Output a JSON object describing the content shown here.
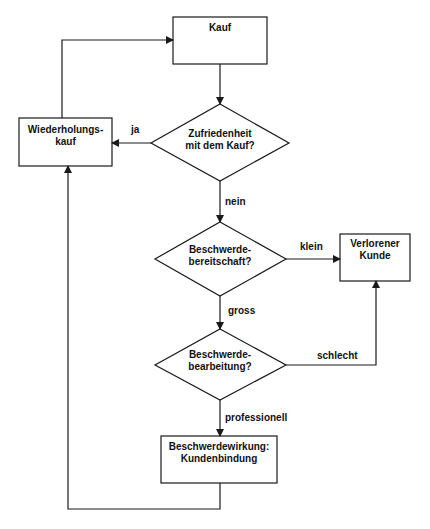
{
  "nodes": {
    "kauf": {
      "label": "Kauf"
    },
    "zufriedenheit": {
      "label": "Zufriedenheit\nmit dem Kauf?"
    },
    "wiederholungskauf": {
      "label": "Wiederholungs-\nkauf"
    },
    "bereitschaft": {
      "label": "Beschwerde-\nbereitschaft?"
    },
    "verlorener_kunde": {
      "label": "Verlorener\nKunde"
    },
    "bearbeitung": {
      "label": "Beschwerde-\nbearbeitung?"
    },
    "kundenbindung": {
      "label": "Beschwerdewirkung:\nKundenbindung"
    }
  },
  "edges": {
    "ja": "ja",
    "nein": "nein",
    "klein": "klein",
    "gross": "gross",
    "schlecht": "schlecht",
    "professionell": "professionell"
  },
  "colors": {
    "stroke": "#1a1a1a",
    "background": "#ffffff"
  }
}
